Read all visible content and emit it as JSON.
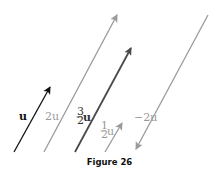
{
  "caption": "Figure 26",
  "colors": {
    "dark": "#111111",
    "mid": "#4a4a4a",
    "light": "#9a9a9a"
  },
  "vectors": [
    {
      "name": "u",
      "label": "u",
      "x1": 14,
      "y1": 152,
      "x2": 50,
      "y2": 87,
      "color": "#111111"
    },
    {
      "name": "2u",
      "label": "2u",
      "x1": 44,
      "y1": 152,
      "x2": 117,
      "y2": 15,
      "color": "#9a9a9a"
    },
    {
      "name": "three-halves-u",
      "label": "3/2 u",
      "x1": 75,
      "y1": 152,
      "x2": 131,
      "y2": 48,
      "color": "#4a4a4a"
    },
    {
      "name": "one-half-u",
      "label": "1/2 u",
      "x1": 105,
      "y1": 152,
      "x2": 122,
      "y2": 123,
      "color": "#9a9a9a"
    },
    {
      "name": "negative-2u",
      "label": "−2u",
      "x1": 208,
      "y1": 15,
      "x2": 136,
      "y2": 149,
      "color": "#9a9a9a"
    }
  ],
  "labels": {
    "u": "u",
    "two_u": "2u",
    "three_halves_num": "3",
    "three_halves_den": "2",
    "three_halves_var": "u",
    "one_half_num": "1",
    "one_half_den": "2",
    "one_half_var": "u",
    "neg_two_u": "−2u"
  }
}
